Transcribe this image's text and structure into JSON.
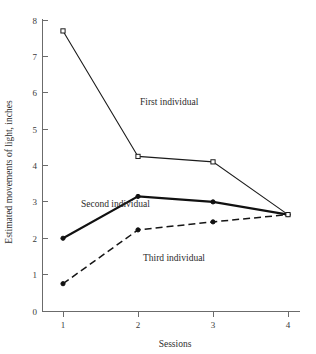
{
  "chart_data": {
    "type": "line",
    "title": "",
    "xlabel": "Sessions",
    "ylabel": "Estimated movements of light, inches",
    "x": [
      1,
      2,
      3,
      4
    ],
    "xticklabels": [
      "1",
      "2",
      "3",
      "4"
    ],
    "yticklabels": [
      "0",
      "1",
      "2",
      "3",
      "4",
      "5",
      "6",
      "7",
      "8"
    ],
    "yticks": [
      0,
      1,
      2,
      3,
      4,
      5,
      6,
      7,
      8
    ],
    "xlim": [
      1,
      4
    ],
    "ylim": [
      0,
      8
    ],
    "grid": false,
    "legend": "inline-annotations",
    "series": [
      {
        "name": "First individual",
        "values": [
          7.7,
          4.25,
          4.1,
          2.65
        ],
        "style": "solid-thin",
        "marker": "open-square",
        "label_x": 140,
        "label_y": 105
      },
      {
        "name": "Second individual",
        "values": [
          2.0,
          3.15,
          3.0,
          2.65
        ],
        "style": "solid-thick",
        "marker": "filled",
        "label_x": 81,
        "label_y": 207
      },
      {
        "name": "Third individual",
        "values": [
          0.75,
          2.23,
          2.45,
          2.65
        ],
        "style": "dashed",
        "marker": "filled",
        "label_x": 143,
        "label_y": 261
      }
    ],
    "annotations": [
      "First individual",
      "Second individual",
      "Third individual"
    ],
    "colors": {
      "first": "#1c1c1c",
      "second": "#111111",
      "third": "#151515",
      "axis": "#6b6b6b",
      "background": "#ffffff"
    }
  },
  "axis": {
    "x_title": "Sessions",
    "y_title": "Estimated movements of light, inches",
    "y_labels": [
      "8",
      "7",
      "6",
      "5",
      "4",
      "3",
      "2",
      "1",
      "0"
    ],
    "x_labels": [
      "1",
      "2",
      "3",
      "4"
    ]
  }
}
